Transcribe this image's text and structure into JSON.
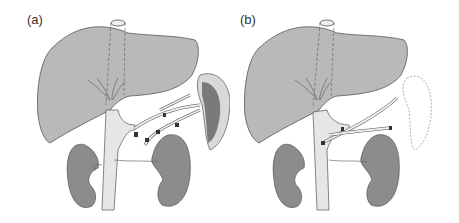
{
  "figure": {
    "panels": [
      {
        "id": "a",
        "label": "(a)",
        "structures": [
          "liver",
          "inferior-vena-cava",
          "hepatic-veins",
          "right-kidney",
          "left-kidney",
          "spleen",
          "splenic-vessels",
          "ligature-clips"
        ],
        "spleen_present": true
      },
      {
        "id": "b",
        "label": "(b)",
        "structures": [
          "liver",
          "inferior-vena-cava",
          "hepatic-veins",
          "right-kidney",
          "left-kidney",
          "spleen-outline-removed",
          "splenic-vessel-stumps",
          "ligature-clips"
        ],
        "spleen_present": false
      }
    ]
  },
  "colors": {
    "liver": "#b9b9b9",
    "kidney": "#8c8c8c",
    "vessel": "#e6e6e6",
    "outline": "#555555",
    "spleen_pulp": "#7a7a7a",
    "spleen_rim": "#d9d9d9"
  }
}
